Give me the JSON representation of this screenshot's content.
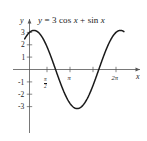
{
  "figure": {
    "name": "trigonometric-function-graph",
    "background_color": "#ffffff",
    "curve_color": "#1a1a1a",
    "axis_color": "#555555"
  },
  "equation": {
    "full": "y = 3 cos x + sin x",
    "lhs": "y",
    "eq": "=",
    "rhs_a": "3 cos",
    "rhs_x1": "x",
    "plus": "+",
    "rhs_b": "sin",
    "rhs_x2": "x"
  },
  "axes": {
    "x_label": "x",
    "y_label": "y",
    "x_ticks": [
      {
        "label": "π/2",
        "display": "π",
        "denominator": "2",
        "value": 1.5707963
      },
      {
        "label": "π",
        "display": "π",
        "denominator": "",
        "value": 3.1415927
      },
      {
        "label": "3π/2",
        "display": "",
        "denominator": "",
        "value": 4.712389
      },
      {
        "label": "2π",
        "display": "2π",
        "denominator": "",
        "value": 6.2831853
      }
    ],
    "y_ticks": [
      "3",
      "2",
      "1",
      "-1",
      "-2",
      "-3"
    ],
    "xlim": [
      -0.35,
      7.2
    ],
    "ylim": [
      -3.8,
      3.8
    ]
  },
  "chart_data": {
    "type": "line",
    "title": "y = 3 cos x + sin x",
    "xlabel": "x",
    "ylabel": "y",
    "xlim": [
      -0.35,
      7.2
    ],
    "ylim": [
      -3.8,
      3.8
    ],
    "grid": false,
    "legend": "none",
    "annotations": [
      "y = 3 cos x + sin x"
    ],
    "amplitude": 3.1622777,
    "phase_shift": 0.3217506,
    "series": [
      {
        "name": "y = 3 cos x + sin x",
        "x": [
          -0.35,
          -0.2,
          0,
          0.32,
          0.6,
          1.0,
          1.3,
          1.5708,
          1.9,
          2.2,
          2.6,
          2.95,
          3.1416,
          3.4632,
          3.8,
          4.2,
          4.6,
          4.7124,
          5.0,
          5.4,
          5.8,
          6.1,
          6.2832,
          6.6,
          7.0,
          7.2
        ],
        "y": [
          2.47,
          2.74,
          3.0,
          3.16,
          3.04,
          2.46,
          1.76,
          1.0,
          -0.08,
          -1.97,
          -3.09,
          -3.12,
          -3.0,
          -3.16,
          -2.99,
          -2.34,
          -1.06,
          -1.0,
          0.89,
          1.92,
          2.78,
          3.09,
          3.0,
          2.86,
          2.92,
          2.96
        ],
        "maxima": [
          {
            "x": 0.3218,
            "y": 3.1623
          },
          {
            "x": 6.605,
            "y": 3.1623
          }
        ],
        "minima": [
          {
            "x": 3.4633,
            "y": -3.1623
          }
        ],
        "zeros": [
          1.8925,
          5.0341
        ]
      }
    ]
  }
}
